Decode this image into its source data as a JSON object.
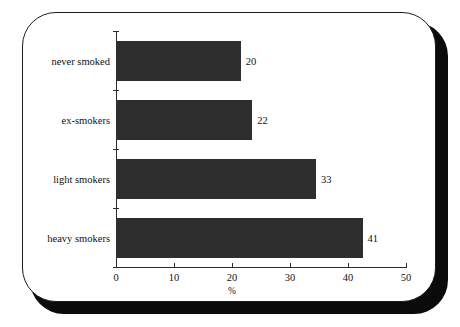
{
  "chart_data": {
    "type": "bar",
    "orientation": "horizontal",
    "title": "",
    "xlabel": "%",
    "ylabel": "",
    "categories": [
      "never smoked",
      "ex-smokers",
      "light smokers",
      "heavy smokers"
    ],
    "values": [
      20,
      22,
      33,
      41
    ],
    "data_labels": [
      "20",
      "22",
      "33",
      "41"
    ],
    "xlim": [
      0,
      50
    ],
    "xticks": [
      0,
      10,
      20,
      30,
      40,
      50
    ],
    "xtick_labels": [
      "0",
      "10",
      "20",
      "30",
      "40",
      "50"
    ],
    "grid": false,
    "legend": null,
    "bar_color": "#2e2e2e",
    "axis_color": "#2b2b2b",
    "text_color": "#111111",
    "background_color": "#ffffff"
  },
  "card": {
    "border_color": "#1c1c1c",
    "shadow_color": "#0b0b0b"
  }
}
